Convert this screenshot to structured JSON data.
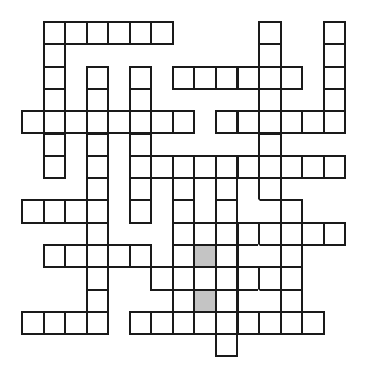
{
  "puzzle": {
    "type": "crossword-grid",
    "columns": 15,
    "rows": 15,
    "colors": {
      "border": "#1a1a1a",
      "cell": "#ffffff",
      "shaded": "#c4c4c4",
      "background": "#ffffff"
    },
    "cells": [
      {
        "r": 0,
        "c": 1
      },
      {
        "r": 0,
        "c": 2
      },
      {
        "r": 0,
        "c": 3
      },
      {
        "r": 0,
        "c": 4
      },
      {
        "r": 0,
        "c": 5
      },
      {
        "r": 0,
        "c": 6
      },
      {
        "r": 0,
        "c": 11
      },
      {
        "r": 0,
        "c": 14
      },
      {
        "r": 1,
        "c": 1
      },
      {
        "r": 1,
        "c": 11
      },
      {
        "r": 1,
        "c": 14
      },
      {
        "r": 2,
        "c": 1
      },
      {
        "r": 2,
        "c": 3
      },
      {
        "r": 2,
        "c": 5
      },
      {
        "r": 2,
        "c": 7
      },
      {
        "r": 2,
        "c": 8
      },
      {
        "r": 2,
        "c": 9
      },
      {
        "r": 2,
        "c": 10
      },
      {
        "r": 2,
        "c": 11
      },
      {
        "r": 2,
        "c": 12
      },
      {
        "r": 2,
        "c": 14
      },
      {
        "r": 3,
        "c": 1
      },
      {
        "r": 3,
        "c": 3
      },
      {
        "r": 3,
        "c": 5
      },
      {
        "r": 3,
        "c": 11
      },
      {
        "r": 3,
        "c": 14
      },
      {
        "r": 4,
        "c": 0
      },
      {
        "r": 4,
        "c": 1
      },
      {
        "r": 4,
        "c": 2
      },
      {
        "r": 4,
        "c": 3
      },
      {
        "r": 4,
        "c": 4
      },
      {
        "r": 4,
        "c": 5
      },
      {
        "r": 4,
        "c": 6
      },
      {
        "r": 4,
        "c": 7
      },
      {
        "r": 4,
        "c": 9
      },
      {
        "r": 4,
        "c": 10
      },
      {
        "r": 4,
        "c": 11
      },
      {
        "r": 4,
        "c": 12
      },
      {
        "r": 4,
        "c": 13
      },
      {
        "r": 4,
        "c": 14
      },
      {
        "r": 5,
        "c": 1
      },
      {
        "r": 5,
        "c": 3
      },
      {
        "r": 5,
        "c": 5
      },
      {
        "r": 5,
        "c": 11
      },
      {
        "r": 6,
        "c": 1
      },
      {
        "r": 6,
        "c": 3
      },
      {
        "r": 6,
        "c": 5
      },
      {
        "r": 6,
        "c": 6
      },
      {
        "r": 6,
        "c": 7
      },
      {
        "r": 6,
        "c": 8
      },
      {
        "r": 6,
        "c": 9
      },
      {
        "r": 6,
        "c": 10
      },
      {
        "r": 6,
        "c": 11
      },
      {
        "r": 6,
        "c": 12
      },
      {
        "r": 6,
        "c": 13
      },
      {
        "r": 6,
        "c": 14
      },
      {
        "r": 7,
        "c": 3
      },
      {
        "r": 7,
        "c": 5
      },
      {
        "r": 7,
        "c": 7
      },
      {
        "r": 7,
        "c": 9
      },
      {
        "r": 7,
        "c": 11
      },
      {
        "r": 8,
        "c": 0
      },
      {
        "r": 8,
        "c": 1
      },
      {
        "r": 8,
        "c": 2
      },
      {
        "r": 8,
        "c": 3
      },
      {
        "r": 8,
        "c": 5
      },
      {
        "r": 8,
        "c": 7
      },
      {
        "r": 8,
        "c": 9
      },
      {
        "r": 8,
        "c": 11,
        "open": "left"
      },
      {
        "r": 8,
        "c": 12
      },
      {
        "r": 9,
        "c": 3
      },
      {
        "r": 9,
        "c": 7
      },
      {
        "r": 9,
        "c": 8
      },
      {
        "r": 9,
        "c": 9
      },
      {
        "r": 9,
        "c": 10
      },
      {
        "r": 9,
        "c": 11
      },
      {
        "r": 9,
        "c": 12
      },
      {
        "r": 9,
        "c": 13
      },
      {
        "r": 9,
        "c": 14
      },
      {
        "r": 10,
        "c": 1
      },
      {
        "r": 10,
        "c": 2
      },
      {
        "r": 10,
        "c": 3
      },
      {
        "r": 10,
        "c": 4
      },
      {
        "r": 10,
        "c": 5
      },
      {
        "r": 10,
        "c": 7
      },
      {
        "r": 10,
        "c": 8,
        "shaded": true
      },
      {
        "r": 10,
        "c": 9
      },
      {
        "r": 10,
        "c": 10,
        "open": "right"
      },
      {
        "r": 10,
        "c": 11,
        "open": "left"
      },
      {
        "r": 10,
        "c": 12
      },
      {
        "r": 11,
        "c": 3
      },
      {
        "r": 11,
        "c": 6
      },
      {
        "r": 11,
        "c": 7
      },
      {
        "r": 11,
        "c": 8
      },
      {
        "r": 11,
        "c": 9
      },
      {
        "r": 11,
        "c": 10
      },
      {
        "r": 11,
        "c": 11
      },
      {
        "r": 11,
        "c": 12
      },
      {
        "r": 12,
        "c": 3
      },
      {
        "r": 12,
        "c": 7
      },
      {
        "r": 12,
        "c": 8,
        "shaded": true
      },
      {
        "r": 12,
        "c": 9
      },
      {
        "r": 12,
        "c": 10,
        "open": "right"
      },
      {
        "r": 12,
        "c": 11,
        "open": "left"
      },
      {
        "r": 12,
        "c": 12
      },
      {
        "r": 13,
        "c": 0
      },
      {
        "r": 13,
        "c": 1
      },
      {
        "r": 13,
        "c": 2
      },
      {
        "r": 13,
        "c": 3
      },
      {
        "r": 13,
        "c": 5
      },
      {
        "r": 13,
        "c": 6
      },
      {
        "r": 13,
        "c": 7
      },
      {
        "r": 13,
        "c": 8
      },
      {
        "r": 13,
        "c": 9
      },
      {
        "r": 13,
        "c": 10
      },
      {
        "r": 13,
        "c": 11
      },
      {
        "r": 13,
        "c": 12
      },
      {
        "r": 13,
        "c": 13
      },
      {
        "r": 14,
        "c": 9
      }
    ]
  }
}
